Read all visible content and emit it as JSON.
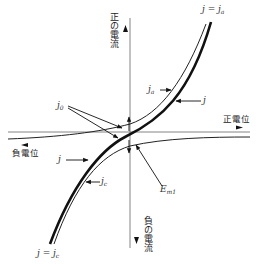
{
  "diagram": {
    "type": "polarization-curve",
    "axes": {
      "vertical_positive_label": "正の電流",
      "vertical_negative_label": "負の電流",
      "horizontal_positive_label": "正電位",
      "horizontal_negative_label": "負電位"
    },
    "curves": [
      {
        "id": "total",
        "label": "j",
        "style": "bold"
      },
      {
        "id": "anodic",
        "label": "j_a",
        "style": "thin"
      },
      {
        "id": "cathodic",
        "label": "j_c",
        "style": "thin"
      }
    ],
    "labels": {
      "top_right": {
        "main": "j = j",
        "sub": "a"
      },
      "bottom_left": {
        "main": "j = j",
        "sub": "c"
      },
      "ja_arrow": {
        "main": "j",
        "sub": "a"
      },
      "j_arrow_right": {
        "main": "j"
      },
      "j_arrow_left": {
        "main": "j"
      },
      "jc_arrow": {
        "main": "j",
        "sub": "c"
      },
      "j0": {
        "main": "j",
        "sub": "0"
      },
      "em": {
        "main": "E",
        "sub": "m1"
      }
    },
    "colors": {
      "line": "#222222",
      "axis": "#555555",
      "background": "#ffffff"
    }
  }
}
